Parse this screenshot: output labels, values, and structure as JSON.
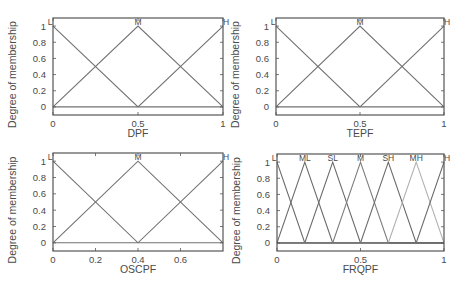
{
  "chart_data": [
    {
      "type": "line",
      "title": "",
      "xlabel": "DPF",
      "ylabel": "Degree of membership",
      "xlim": [
        0,
        1
      ],
      "ylim": [
        -0.1,
        1.1
      ],
      "xticks": [
        0,
        0.5,
        1
      ],
      "xtick_labels": [
        "0",
        "0.5",
        "1"
      ],
      "yticks": [
        0,
        0.2,
        0.4,
        0.6,
        0.8,
        1
      ],
      "ytick_labels": [
        "0",
        "0.2",
        "0.4",
        "0.6",
        "0.8",
        "1"
      ],
      "grid": false,
      "series": [
        {
          "name": "L",
          "mf": "trimf",
          "params": [
            -0.5,
            0,
            0.5
          ],
          "color": "#727272"
        },
        {
          "name": "M",
          "mf": "trimf",
          "params": [
            0,
            0.5,
            1
          ],
          "color": "#727272"
        },
        {
          "name": "H",
          "mf": "trimf",
          "params": [
            0.5,
            1,
            1.5
          ],
          "color": "#727272"
        }
      ]
    },
    {
      "type": "line",
      "title": "",
      "xlabel": "TEPF",
      "ylabel": "Degree of membership",
      "xlim": [
        0,
        1
      ],
      "ylim": [
        -0.1,
        1.1
      ],
      "xticks": [
        0,
        0.5,
        1
      ],
      "xtick_labels": [
        "0",
        "0.5",
        "1"
      ],
      "yticks": [
        0,
        0.2,
        0.4,
        0.6,
        0.8,
        1
      ],
      "ytick_labels": [
        "0",
        "0.2",
        "0.4",
        "0.6",
        "0.8",
        "1"
      ],
      "grid": false,
      "series": [
        {
          "name": "L",
          "mf": "trimf",
          "params": [
            -0.5,
            0,
            0.5
          ],
          "color": "#727272"
        },
        {
          "name": "M",
          "mf": "trimf",
          "params": [
            0,
            0.5,
            1
          ],
          "color": "#727272"
        },
        {
          "name": "H",
          "mf": "trimf",
          "params": [
            0.5,
            1,
            1.5
          ],
          "color": "#727272"
        }
      ]
    },
    {
      "type": "line",
      "title": "",
      "xlabel": "OSCPF",
      "ylabel": "Degree of membership",
      "xlim": [
        0,
        0.8
      ],
      "ylim": [
        -0.1,
        1.1
      ],
      "xticks": [
        0,
        0.2,
        0.4,
        0.6
      ],
      "xtick_labels": [
        "0",
        "0.2",
        "0.4",
        "0.6"
      ],
      "yticks": [
        0,
        0.2,
        0.4,
        0.6,
        0.8,
        1
      ],
      "ytick_labels": [
        "0",
        "0.2",
        "0.4",
        "0.6",
        "0.8",
        "1"
      ],
      "grid": false,
      "series": [
        {
          "name": "L",
          "mf": "trimf",
          "params": [
            -0.4,
            0,
            0.4
          ],
          "color": "#727272"
        },
        {
          "name": "M",
          "mf": "trimf",
          "params": [
            0,
            0.4,
            0.8
          ],
          "color": "#727272"
        },
        {
          "name": "H",
          "mf": "trimf",
          "params": [
            0.4,
            0.8,
            1.2
          ],
          "color": "#727272"
        }
      ]
    },
    {
      "type": "line",
      "title": "",
      "xlabel": "FRQPF",
      "ylabel": "Degree of membership",
      "xlim": [
        0,
        1
      ],
      "ylim": [
        -0.1,
        1.1
      ],
      "xticks": [
        0,
        0.5,
        1
      ],
      "xtick_labels": [
        "0",
        "0.5",
        "1"
      ],
      "yticks": [
        0,
        0.2,
        0.4,
        0.6,
        0.8,
        1
      ],
      "ytick_labels": [
        "0",
        "0.2",
        "0.4",
        "0.6",
        "0.8",
        "1"
      ],
      "grid": false,
      "series": [
        {
          "name": "L",
          "mf": "trimf",
          "params": [
            -0.1667,
            0,
            0.1667
          ],
          "color": "#6a6a6a"
        },
        {
          "name": "ML",
          "mf": "trimf",
          "params": [
            0,
            0.1667,
            0.3333
          ],
          "color": "#6a6a6a"
        },
        {
          "name": "SL",
          "mf": "trimf",
          "params": [
            0.1667,
            0.3333,
            0.5
          ],
          "color": "#6a6a6a"
        },
        {
          "name": "M",
          "mf": "trimf",
          "params": [
            0.3333,
            0.5,
            0.6667
          ],
          "color": "#7c7c7c"
        },
        {
          "name": "SH",
          "mf": "trimf",
          "params": [
            0.5,
            0.6667,
            0.8333
          ],
          "color": "#6a6a6a"
        },
        {
          "name": "MH",
          "mf": "trimf",
          "params": [
            0.6667,
            0.8333,
            1
          ],
          "color": "#b0b0b0"
        },
        {
          "name": "H",
          "mf": "trimf",
          "params": [
            0.8333,
            1,
            1.1667
          ],
          "color": "#6a6a6a"
        }
      ]
    }
  ],
  "colors": {
    "axes_frame": "#555555",
    "text": "#4a4a4a",
    "background": "#ffffff"
  }
}
